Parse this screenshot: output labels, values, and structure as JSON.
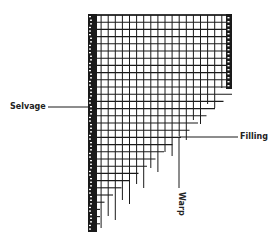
{
  "diagram": {
    "labels": {
      "selvage": "Selvage",
      "filling": "Filling",
      "warp": "Warp"
    },
    "colors": {
      "ink": "#1a1a1a",
      "background": "#ffffff"
    }
  }
}
